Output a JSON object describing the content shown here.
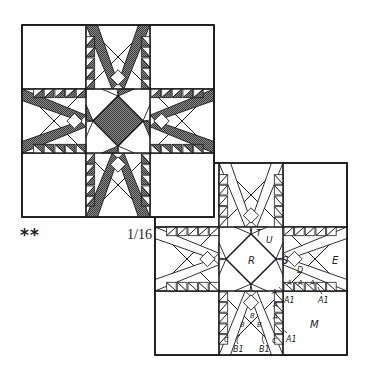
{
  "figure": {
    "title_marks": "**",
    "scale_label": "1/16",
    "colors": {
      "line": "#1a1a1a",
      "shade": "#6b6b6b",
      "background": "#ffffff"
    }
  },
  "shaded_block": {
    "description": "Feathered star quilt block, shaded",
    "x": 22,
    "y": 25,
    "size": 192
  },
  "pattern_block": {
    "description": "Feathered star quilt block pattern, outline with piece labels",
    "x": 155,
    "y": 163,
    "size": 192,
    "labels": {
      "R": "R",
      "T": "T",
      "U": "U",
      "S": "S",
      "E": "E",
      "D": "D",
      "M": "M",
      "A": "A",
      "A1": "A1",
      "B": "B",
      "B1": "B1",
      "C": "C"
    }
  }
}
